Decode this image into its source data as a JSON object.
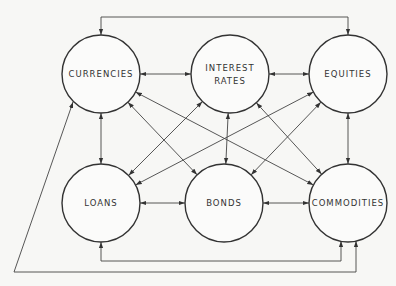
{
  "diagram": {
    "nodes": [
      {
        "id": "currencies",
        "lines": [
          "CURRENCIES"
        ]
      },
      {
        "id": "interest_rates",
        "lines": [
          "INTEREST",
          "RATES"
        ]
      },
      {
        "id": "equities",
        "lines": [
          "EQUITIES"
        ]
      },
      {
        "id": "loans",
        "lines": [
          "LOANS"
        ]
      },
      {
        "id": "bonds",
        "lines": [
          "BONDS"
        ]
      },
      {
        "id": "commodities",
        "lines": [
          "COMMODITIES"
        ]
      }
    ],
    "edges": [
      {
        "from": "currencies",
        "to": "interest_rates",
        "bidirectional": true
      },
      {
        "from": "interest_rates",
        "to": "equities",
        "bidirectional": true
      },
      {
        "from": "loans",
        "to": "bonds",
        "bidirectional": true
      },
      {
        "from": "bonds",
        "to": "commodities",
        "bidirectional": true
      },
      {
        "from": "currencies",
        "to": "loans",
        "bidirectional": true
      },
      {
        "from": "interest_rates",
        "to": "bonds",
        "bidirectional": true
      },
      {
        "from": "equities",
        "to": "commodities",
        "bidirectional": true
      },
      {
        "from": "currencies",
        "to": "bonds",
        "bidirectional": true
      },
      {
        "from": "currencies",
        "to": "commodities",
        "bidirectional": true
      },
      {
        "from": "interest_rates",
        "to": "loans",
        "bidirectional": true
      },
      {
        "from": "interest_rates",
        "to": "commodities",
        "bidirectional": true
      },
      {
        "from": "equities",
        "to": "loans",
        "bidirectional": true
      },
      {
        "from": "equities",
        "to": "bonds",
        "bidirectional": true
      },
      {
        "from": "currencies",
        "to": "equities",
        "bidirectional": true,
        "routing": "top-loop"
      },
      {
        "from": "loans",
        "to": "commodities",
        "bidirectional": true,
        "routing": "bottom-loop"
      },
      {
        "from": "currencies",
        "to": "commodities",
        "bidirectional": true,
        "routing": "outer-loop"
      }
    ]
  }
}
